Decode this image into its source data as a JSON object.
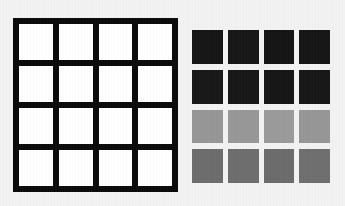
{
  "background_color": "#f2f2f2",
  "left_grid": {
    "name": "black-framed-white-cell-grid",
    "frame_color": "#0a0a0a",
    "rows": 4,
    "columns": 4,
    "cells": [
      [
        {
          "label": "r1c1",
          "color": "#ffffff"
        },
        {
          "label": "r1c2",
          "color": "#ffffff"
        },
        {
          "label": "r1c3",
          "color": "#ffffff"
        },
        {
          "label": "r1c4",
          "color": "#ffffff"
        }
      ],
      [
        {
          "label": "r2c1",
          "color": "#ffffff"
        },
        {
          "label": "r2c2",
          "color": "#ffffff"
        },
        {
          "label": "r2c3",
          "color": "#ffffff"
        },
        {
          "label": "r2c4",
          "color": "#ffffff"
        }
      ],
      [
        {
          "label": "r3c1",
          "color": "#ffffff"
        },
        {
          "label": "r3c2",
          "color": "#ffffff"
        },
        {
          "label": "r3c3",
          "color": "#ffffff"
        },
        {
          "label": "r3c4",
          "color": "#ffffff"
        }
      ],
      [
        {
          "label": "r4c1",
          "color": "#ffffff"
        },
        {
          "label": "r4c2",
          "color": "#ffffff"
        },
        {
          "label": "r4c3",
          "color": "#ffffff"
        },
        {
          "label": "r4c4",
          "color": "#ffffff"
        }
      ]
    ]
  },
  "right_grid": {
    "name": "grayscale-patch-array",
    "rows": 4,
    "columns": 4,
    "cells": [
      [
        {
          "label": "r1c1",
          "color": "#151515"
        },
        {
          "label": "r1c2",
          "color": "#161616"
        },
        {
          "label": "r1c3",
          "color": "#141414"
        },
        {
          "label": "r1c4",
          "color": "#151515"
        }
      ],
      [
        {
          "label": "r2c1",
          "color": "#171717"
        },
        {
          "label": "r2c2",
          "color": "#161616"
        },
        {
          "label": "r2c3",
          "color": "#151515"
        },
        {
          "label": "r2c4",
          "color": "#161616"
        }
      ],
      [
        {
          "label": "r3c1",
          "color": "#969696"
        },
        {
          "label": "r3c2",
          "color": "#979797"
        },
        {
          "label": "r3c3",
          "color": "#9a9a9a"
        },
        {
          "label": "r3c4",
          "color": "#969696"
        }
      ],
      [
        {
          "label": "r4c1",
          "color": "#6c6c6c"
        },
        {
          "label": "r4c2",
          "color": "#6d6d6d"
        },
        {
          "label": "r4c3",
          "color": "#6b6b6b"
        },
        {
          "label": "r4c4",
          "color": "#6e6e6e"
        }
      ]
    ]
  }
}
